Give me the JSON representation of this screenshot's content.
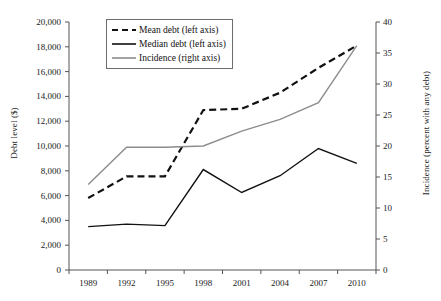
{
  "chart_data": {
    "type": "line",
    "title": "",
    "xlabel": "",
    "ylabel": "Debt level ($)",
    "y2label": "Incidence (percent with any debt)",
    "categories": [
      "1989",
      "1992",
      "1995",
      "1998",
      "2001",
      "2004",
      "2007",
      "2010"
    ],
    "x": [
      1989,
      1992,
      1995,
      1998,
      2001,
      2004,
      2007,
      2010
    ],
    "ylim": [
      0,
      20000
    ],
    "y2lim": [
      0,
      40
    ],
    "yticks": [
      "0",
      "2,000",
      "4,000",
      "6,000",
      "8,000",
      "10,000",
      "12,000",
      "14,000",
      "16,000",
      "18,000",
      "20,000"
    ],
    "ytick_values": [
      0,
      2000,
      4000,
      6000,
      8000,
      10000,
      12000,
      14000,
      16000,
      18000,
      20000
    ],
    "y2ticks": [
      "0",
      "5",
      "10",
      "15",
      "20",
      "25",
      "30",
      "35",
      "40"
    ],
    "y2tick_values": [
      0,
      5,
      10,
      15,
      20,
      25,
      30,
      35,
      40
    ],
    "grid": false,
    "legend_position": "top-left-inside",
    "series": [
      {
        "name": "Mean debt (left axis)",
        "axis": "left",
        "style": "dashed",
        "color": "#111111",
        "values": [
          5800,
          7550,
          7550,
          12900,
          13000,
          14300,
          16300,
          18100
        ]
      },
      {
        "name": "Median debt (left axis)",
        "axis": "left",
        "style": "solid",
        "color": "#111111",
        "values": [
          3500,
          3700,
          3580,
          8100,
          6250,
          7600,
          9800,
          8600
        ]
      },
      {
        "name": "Incidence (right axis)",
        "axis": "right",
        "style": "solid",
        "color": "#8c8c8c",
        "values": [
          13.8,
          19.8,
          19.8,
          20.0,
          22.4,
          24.3,
          27.0,
          36.2
        ]
      }
    ]
  },
  "axes": {
    "left_title": "Debt level ($)",
    "right_title": "Incidence (percent with any debt)"
  },
  "legend": {
    "items": [
      {
        "label": "Mean debt (left axis)",
        "icon": "dashed-line-swatch"
      },
      {
        "label": "Median debt (left axis)",
        "icon": "solid-line-swatch"
      },
      {
        "label": "Incidence (right axis)",
        "icon": "gray-line-swatch"
      }
    ]
  }
}
